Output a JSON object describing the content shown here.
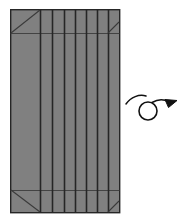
{
  "figure": {
    "type": "origami-fold-diagram",
    "background_color": "#ffffff",
    "canvas": {
      "width": 185,
      "height": 224
    }
  },
  "paper": {
    "name": "pleated-paper-sheet",
    "fill_color": "#808080",
    "outline_color": "#262626",
    "outline_width": 1.4,
    "bounds": {
      "x": 10,
      "y": 9,
      "width": 110,
      "height": 204
    }
  },
  "crease_style": {
    "fold_line_color": "#262626",
    "fold_line_width": 1.6,
    "band_line_color": "#3c3c3c",
    "band_line_width": 0.9,
    "diagonal_line_color": "#3a3a3a",
    "diagonal_line_width": 1.1
  },
  "pleats": {
    "label": "vertical pleat crease lines",
    "count": 7,
    "x_positions": [
      40,
      52,
      64,
      75,
      86,
      97,
      108
    ]
  },
  "bands": {
    "label": "horizontal band crease lines",
    "top_y": 33,
    "bottom_y": 190
  },
  "corner_folds": [
    {
      "name": "top-left-diagonal",
      "x1": 11,
      "y1": 33,
      "x2": 40,
      "y2": 10
    },
    {
      "name": "top-right-diagonal",
      "x1": 108,
      "y1": 33,
      "x2": 119,
      "y2": 22
    },
    {
      "name": "bottom-left-diagonal",
      "x1": 11,
      "y1": 190,
      "x2": 40,
      "y2": 212
    },
    {
      "name": "bottom-right-diagonal",
      "x1": 108,
      "y1": 212,
      "x2": 119,
      "y2": 201
    }
  ],
  "turn_over_symbol": {
    "name": "turn-over-loop-arrow",
    "meaning": "turn the model over",
    "stroke_color": "#111111",
    "stroke_width": 1.6,
    "loop": {
      "cx": 148,
      "cy": 111,
      "r": 9
    },
    "tail": {
      "start_x": 126,
      "start_y": 103,
      "end_x": 170,
      "end_y": 104
    },
    "arrow_head": {
      "tip_x": 177,
      "tip_y": 101
    }
  }
}
